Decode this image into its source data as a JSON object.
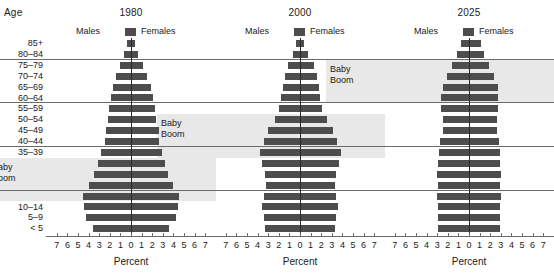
{
  "figure": {
    "age_axis_label": "Age",
    "x_axis_label": "Percent",
    "age_groups": [
      "85+",
      "80–84",
      "75–79",
      "70–74",
      "65–69",
      "60–64",
      "55–59",
      "50–54",
      "45–49",
      "40–44",
      "35–39",
      "30–34",
      "25–29",
      "20–24",
      "15–19",
      "10–14",
      "5–9",
      "< 5"
    ],
    "tick_labels": [
      "7",
      "6",
      "5",
      "4",
      "3",
      "2",
      "1",
      "0",
      "1",
      "2",
      "3",
      "4",
      "5",
      "6",
      "7"
    ],
    "legend": {
      "males_label": "Males",
      "females_label": "Females",
      "swatch_color": "#4d4d4d"
    },
    "annotation_label": "Baby\nBoom",
    "annotation_line1": "Baby",
    "annotation_line2": "Boom",
    "colors": {
      "bar": "#4d4d4d",
      "band": "#e8e8e8",
      "grid": "#6b6b6b",
      "text": "#1a1a1a"
    },
    "gridline_ages": [
      "80–84",
      "60–64",
      "40–44",
      "20–24"
    ]
  },
  "chart_data": {
    "type": "bar",
    "title": "",
    "xlabel": "Percent",
    "ylabel": "Age",
    "xlim": [
      -7,
      7
    ],
    "grid": true,
    "legend_position": "top",
    "categories": [
      "85+",
      "80–84",
      "75–79",
      "70–74",
      "65–69",
      "60–64",
      "55–59",
      "50–54",
      "45–49",
      "40–44",
      "35–39",
      "30–34",
      "25–29",
      "20–24",
      "15–19",
      "10–14",
      "5–9",
      "< 5"
    ],
    "panels": [
      {
        "title": "1980",
        "baby_boom_range": [
          "15–19",
          "30–34"
        ],
        "series": [
          {
            "name": "Males",
            "values": [
              0.4,
              0.7,
              1.0,
              1.4,
              1.7,
              1.9,
              2.1,
              2.2,
              2.4,
              2.5,
              2.8,
              3.1,
              3.5,
              4.0,
              4.5,
              4.4,
              4.2,
              3.6
            ]
          },
          {
            "name": "Females",
            "values": [
              0.4,
              0.7,
              1.1,
              1.5,
              1.9,
              2.1,
              2.3,
              2.4,
              2.6,
              2.6,
              2.9,
              3.2,
              3.5,
              4.0,
              4.5,
              4.4,
              4.2,
              3.6
            ]
          }
        ]
      },
      {
        "title": "2000",
        "baby_boom_range": [
          "35–39",
          "50–54"
        ],
        "series": [
          {
            "name": "Males",
            "values": [
              0.4,
              0.7,
              1.1,
              1.4,
              1.6,
              1.8,
              2.0,
              2.4,
              3.0,
              3.4,
              3.8,
              3.6,
              3.3,
              3.2,
              3.4,
              3.6,
              3.4,
              3.3
            ]
          },
          {
            "name": "Females",
            "values": [
              0.4,
              0.8,
              1.3,
              1.6,
              1.8,
              1.9,
              2.1,
              2.5,
              3.1,
              3.5,
              3.9,
              3.7,
              3.4,
              3.3,
              3.4,
              3.6,
              3.4,
              3.3
            ]
          }
        ]
      },
      {
        "title": "2025",
        "baby_boom_range": [
          "60–64",
          "75–79"
        ],
        "series": [
          {
            "name": "Males",
            "values": [
              0.8,
              1.1,
              1.6,
              2.1,
              2.5,
              2.6,
              2.6,
              2.5,
              2.5,
              2.7,
              2.8,
              2.9,
              3.0,
              2.9,
              3.0,
              2.9,
              2.9,
              2.9
            ]
          },
          {
            "name": "Females",
            "values": [
              1.1,
              1.4,
              1.9,
              2.4,
              2.7,
              2.7,
              2.7,
              2.6,
              2.6,
              2.8,
              2.9,
              2.9,
              3.0,
              2.9,
              3.0,
              2.9,
              2.9,
              2.9
            ]
          }
        ]
      }
    ]
  }
}
